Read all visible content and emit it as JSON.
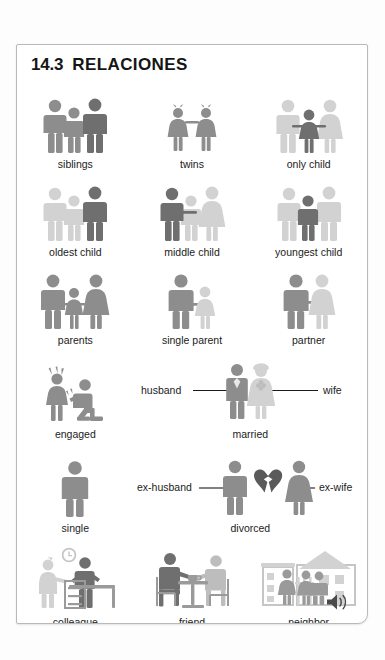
{
  "page": {
    "section_number": "14.3",
    "section_title": "RELACIONES",
    "audio_icon": "speaker-icon"
  },
  "colors": {
    "figure_dark": "#6f6f6f",
    "figure_mid": "#8d8d8d",
    "figure_light": "#d2d2d2",
    "heart_dark": "#5a5a5a",
    "text": "#1b1b1b",
    "card_border": "#b9b9b9",
    "page_background": "#ffffff"
  },
  "rows": [
    {
      "cells": [
        {
          "label": "siblings",
          "icon": "three-siblings-icon"
        },
        {
          "label": "twins",
          "icon": "twin-girls-icon"
        },
        {
          "label": "only child",
          "icon": "only-child-icon"
        }
      ]
    },
    {
      "cells": [
        {
          "label": "oldest child",
          "icon": "oldest-child-icon"
        },
        {
          "label": "middle child",
          "icon": "middle-child-icon"
        },
        {
          "label": "youngest child",
          "icon": "youngest-child-icon"
        }
      ]
    },
    {
      "cells": [
        {
          "label": "parents",
          "icon": "parents-icon"
        },
        {
          "label": "single parent",
          "icon": "single-parent-icon"
        },
        {
          "label": "partner",
          "icon": "partner-icon"
        }
      ]
    },
    {
      "cells": [
        {
          "label": "engaged",
          "icon": "engagement-proposal-icon"
        },
        {
          "label": "married",
          "icon": "married-couple-icon",
          "callouts": [
            {
              "text": "husband",
              "side": "left"
            },
            {
              "text": "wife",
              "side": "right"
            }
          ]
        }
      ]
    },
    {
      "cells": [
        {
          "label": "single",
          "icon": "single-person-icon"
        },
        {
          "label": "divorced",
          "icon": "divorced-broken-heart-icon",
          "callouts": [
            {
              "text": "ex-husband",
              "side": "left"
            },
            {
              "text": "ex-wife",
              "side": "right"
            }
          ]
        }
      ]
    },
    {
      "cells": [
        {
          "label": "colleague",
          "icon": "colleague-office-icon"
        },
        {
          "label": "friend",
          "icon": "friends-table-icon"
        },
        {
          "label": "neighbor",
          "icon": "neighbor-houses-icon"
        }
      ]
    }
  ]
}
